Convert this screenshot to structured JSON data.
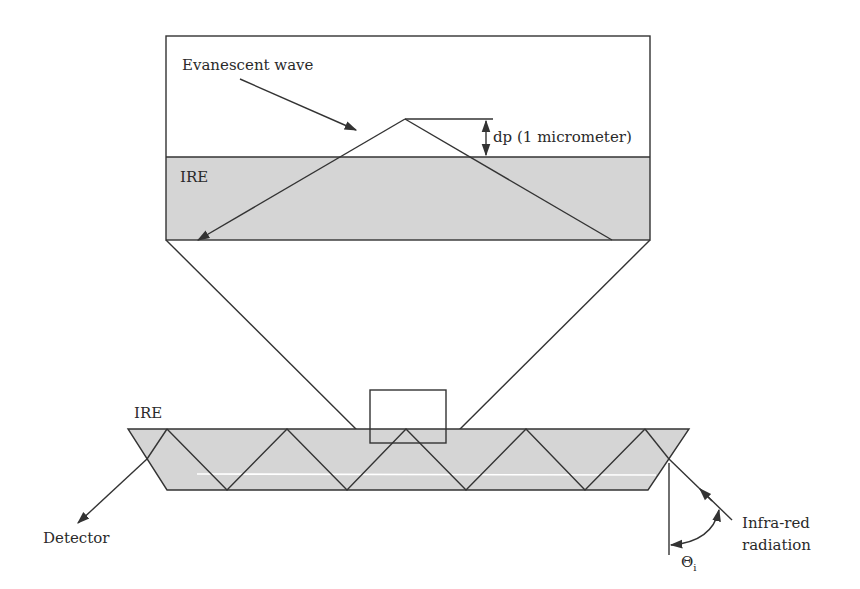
{
  "diagram": {
    "colors": {
      "line": "#333333",
      "ire_fill": "#d5d5d5",
      "background": "#ffffff",
      "highlight_line": "#ffffff"
    },
    "inset": {
      "evanescent_label": "Evanescent wave",
      "depth_label": "dp (1 micrometer)",
      "ire_label": "IRE"
    },
    "crystal": {
      "ire_label": "IRE",
      "detector_label": "Detector",
      "source_label_line1": "Infra-red",
      "source_label_line2": "radiation",
      "angle_symbol": "Θ",
      "angle_subscript": "i",
      "reflection_count_top": 5,
      "reflection_count_bottom": 4
    }
  }
}
